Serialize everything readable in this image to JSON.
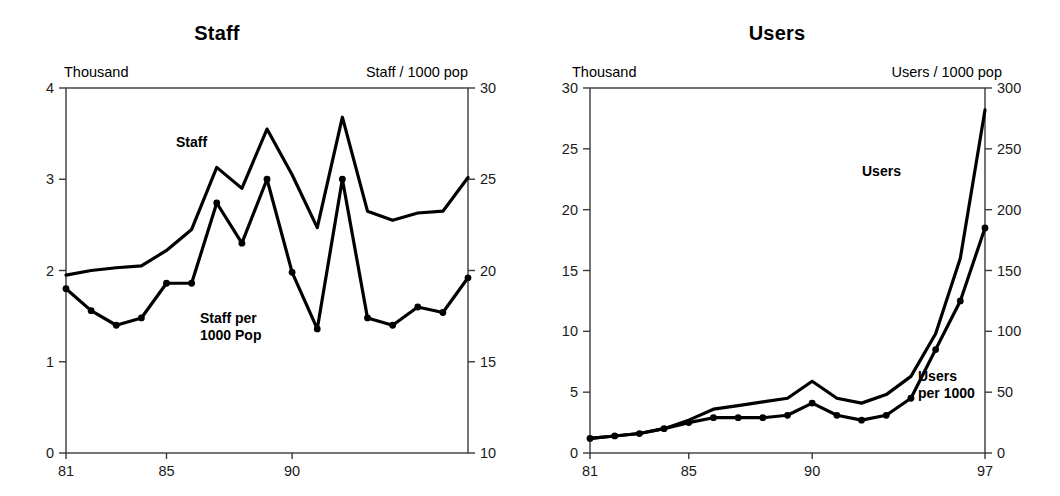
{
  "chart_data": [
    {
      "type": "line",
      "title": "Staff",
      "xlabel": "",
      "ylabel": "Thousand",
      "y2label": "Staff / 1000 pop",
      "x": [
        81,
        82,
        83,
        84,
        85,
        86,
        87,
        88,
        89,
        90,
        91,
        92,
        93,
        94,
        95,
        96,
        97
      ],
      "xtick_labels": [
        "81",
        "85",
        "90"
      ],
      "xtick_values": [
        81,
        85,
        90
      ],
      "xlim": [
        81,
        97
      ],
      "ylim": [
        0,
        4
      ],
      "ytick_labels": [
        "0",
        "1",
        "2",
        "3",
        "4"
      ],
      "ytick_values": [
        0,
        1,
        2,
        3,
        4
      ],
      "y2lim": [
        10,
        30
      ],
      "y2tick_labels": [
        "10",
        "15",
        "20",
        "25",
        "30"
      ],
      "y2tick_values": [
        10,
        15,
        20,
        25,
        30
      ],
      "grid": false,
      "legend": "inline-annotations",
      "series": [
        {
          "name": "Staff",
          "axis": "left",
          "units": "Thousand",
          "markers": false,
          "values": [
            1.95,
            2.0,
            2.03,
            2.05,
            2.22,
            2.45,
            3.13,
            2.9,
            3.55,
            3.05,
            2.47,
            3.68,
            2.65,
            2.55,
            2.63,
            2.65,
            3.02
          ]
        },
        {
          "name": "Staff per 1000 Pop",
          "axis": "right",
          "units": "Staff / 1000 pop",
          "markers": true,
          "values": [
            19.0,
            17.8,
            17.0,
            17.4,
            19.3,
            19.3,
            23.7,
            21.5,
            25.0,
            19.9,
            16.8,
            25.0,
            17.4,
            17.0,
            18.0,
            17.7,
            19.6
          ]
        }
      ]
    },
    {
      "type": "line",
      "title": "Users",
      "xlabel": "",
      "ylabel": "Thousand",
      "y2label": "Users / 1000 pop",
      "x": [
        81,
        82,
        83,
        84,
        85,
        86,
        87,
        88,
        89,
        90,
        91,
        92,
        93,
        94,
        95,
        96,
        97
      ],
      "xtick_labels": [
        "81",
        "85",
        "90",
        "97"
      ],
      "xtick_values": [
        81,
        85,
        90,
        97
      ],
      "xlim": [
        81,
        97
      ],
      "ylim": [
        0,
        30
      ],
      "ytick_labels": [
        "0",
        "5",
        "10",
        "15",
        "20",
        "25",
        "30"
      ],
      "ytick_values": [
        0,
        5,
        10,
        15,
        20,
        25,
        30
      ],
      "y2lim": [
        0,
        300
      ],
      "y2tick_labels": [
        "0",
        "50",
        "100",
        "150",
        "200",
        "250",
        "300"
      ],
      "y2tick_values": [
        0,
        50,
        100,
        150,
        200,
        250,
        300
      ],
      "grid": false,
      "legend": "inline-annotations",
      "series": [
        {
          "name": "Users",
          "axis": "left",
          "units": "Thousand",
          "markers": false,
          "values": [
            1.2,
            1.4,
            1.6,
            2.0,
            2.7,
            3.6,
            3.9,
            4.2,
            4.5,
            5.9,
            4.5,
            4.1,
            4.8,
            6.3,
            9.8,
            16.0,
            28.2
          ]
        },
        {
          "name": "Users per 1000",
          "axis": "right",
          "units": "Users / 1000 pop",
          "markers": true,
          "values": [
            12,
            14,
            16,
            20,
            25,
            29,
            29,
            29,
            31,
            41,
            31,
            27,
            31,
            45,
            85,
            125,
            185
          ]
        }
      ]
    }
  ],
  "charts": [
    {
      "title": "Staff",
      "left_caption": "Thousand",
      "right_caption": "Staff / 1000 pop",
      "series_label_1": "Staff",
      "series_label_2_line1": "Staff per",
      "series_label_2_line2": "1000 Pop"
    },
    {
      "title": "Users",
      "left_caption": "Thousand",
      "right_caption": "Users / 1000 pop",
      "series_label_1": "Users",
      "series_label_2_line1": "Users",
      "series_label_2_line2": "per 1000"
    }
  ],
  "colors": {
    "ink": "#000000",
    "axis": "#3a3a3a",
    "background": "#ffffff"
  }
}
